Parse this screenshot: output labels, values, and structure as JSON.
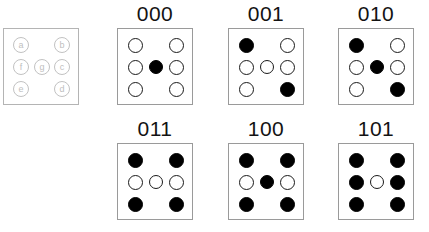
{
  "figure": {
    "cell_positions": [
      "a",
      "b",
      "f",
      "g",
      "c",
      "e",
      "d"
    ],
    "legend": {
      "labels": {
        "a": "a",
        "b": "b",
        "f": "f",
        "g": "g",
        "c": "c",
        "e": "e",
        "d": "d"
      }
    },
    "colors": {
      "filled": "#000000",
      "empty": "#ffffff",
      "outline": "#1a1a1a",
      "box_border": "#9a9a9a",
      "legend_outline": "#c2c2c2",
      "label_text": "#131313"
    },
    "panels": [
      {
        "label": "000",
        "states": {
          "a": "empty",
          "b": "empty",
          "f": "empty",
          "g": "filled",
          "c": "empty",
          "e": "empty",
          "d": "empty"
        }
      },
      {
        "label": "001",
        "states": {
          "a": "filled",
          "b": "empty",
          "f": "empty",
          "g": "empty",
          "c": "empty",
          "e": "empty",
          "d": "filled"
        }
      },
      {
        "label": "010",
        "states": {
          "a": "filled",
          "b": "empty",
          "f": "empty",
          "g": "filled",
          "c": "empty",
          "e": "empty",
          "d": "filled"
        }
      },
      {
        "label": "011",
        "states": {
          "a": "filled",
          "b": "filled",
          "f": "empty",
          "g": "empty",
          "c": "empty",
          "e": "filled",
          "d": "filled"
        }
      },
      {
        "label": "100",
        "states": {
          "a": "filled",
          "b": "filled",
          "f": "empty",
          "g": "filled",
          "c": "empty",
          "e": "filled",
          "d": "filled"
        }
      },
      {
        "label": "101",
        "states": {
          "a": "filled",
          "b": "filled",
          "f": "filled",
          "g": "empty",
          "c": "filled",
          "e": "filled",
          "d": "filled"
        }
      }
    ]
  }
}
